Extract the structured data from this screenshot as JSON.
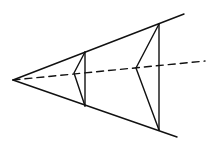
{
  "diagram": {
    "stroke_color": "#111111",
    "apex": [
      13,
      80
    ],
    "upper_edge_end": [
      184,
      14
    ],
    "lower_edge_end": [
      177,
      137
    ],
    "axis_end": [
      205,
      61
    ],
    "sections": [
      {
        "name": "near",
        "top": [
          85,
          52
        ],
        "bottom": [
          85,
          106
        ],
        "vertex": [
          74,
          73
        ]
      },
      {
        "name": "far",
        "top": [
          159,
          24
        ],
        "bottom": [
          159,
          130
        ],
        "vertex": [
          136,
          68
        ]
      }
    ]
  }
}
